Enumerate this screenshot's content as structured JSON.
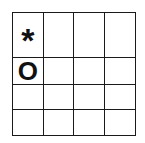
{
  "board": {
    "rows": 4,
    "cols": 4,
    "cells": [
      [
        "*",
        "",
        "",
        ""
      ],
      [
        "O",
        "",
        "",
        ""
      ],
      [
        "",
        "",
        "",
        ""
      ],
      [
        "",
        "",
        "",
        ""
      ]
    ]
  }
}
